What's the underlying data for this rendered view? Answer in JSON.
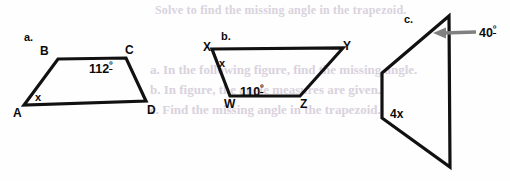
{
  "worksheet": {
    "figures": [
      {
        "item_label": "a.",
        "shape": "trapezoid",
        "vertex_labels": [
          "A",
          "B",
          "C",
          "D"
        ],
        "angle_labels": [
          {
            "name": "angle-C",
            "text": "112",
            "degree_symbol": "º"
          }
        ],
        "variable_labels": [
          {
            "name": "angle-A-variable",
            "text": "x"
          }
        ],
        "points": "58,59 126,58 146,101 24,105"
      },
      {
        "item_label": "b.",
        "shape": "trapezoid",
        "vertex_labels": [
          "X",
          "Y",
          "W",
          "Z"
        ],
        "angle_labels": [
          {
            "name": "angle-W",
            "text": "110",
            "degree_symbol": "º"
          }
        ],
        "variable_labels": [
          {
            "name": "angle-X-variable",
            "text": "x"
          }
        ],
        "points": "212,49 343,48 300,96 230,96"
      },
      {
        "item_label": "c.",
        "shape": "quadrilateral",
        "vertex_labels": [],
        "angle_labels": [
          {
            "name": "angle-apex",
            "text": "40",
            "degree_symbol": "º"
          }
        ],
        "variable_labels": [
          {
            "name": "angle-left-variable",
            "text": "4x"
          }
        ],
        "points": "449,16 450,167 382,118 382,73"
      }
    ],
    "bleed_through_lines": [
      "Solve to find the missing angle in the trapezoid.",
      "a. In the following figure, find the missing angle.",
      "b. In figure, the angle measures are given.",
      "c. Find the missing angle in the trapezoid."
    ],
    "colors": {
      "stroke": "#111111",
      "arrow": "#808080",
      "text": "#0b0b0b",
      "bleed": "#d9d2dd",
      "background": "#fefefe"
    }
  }
}
